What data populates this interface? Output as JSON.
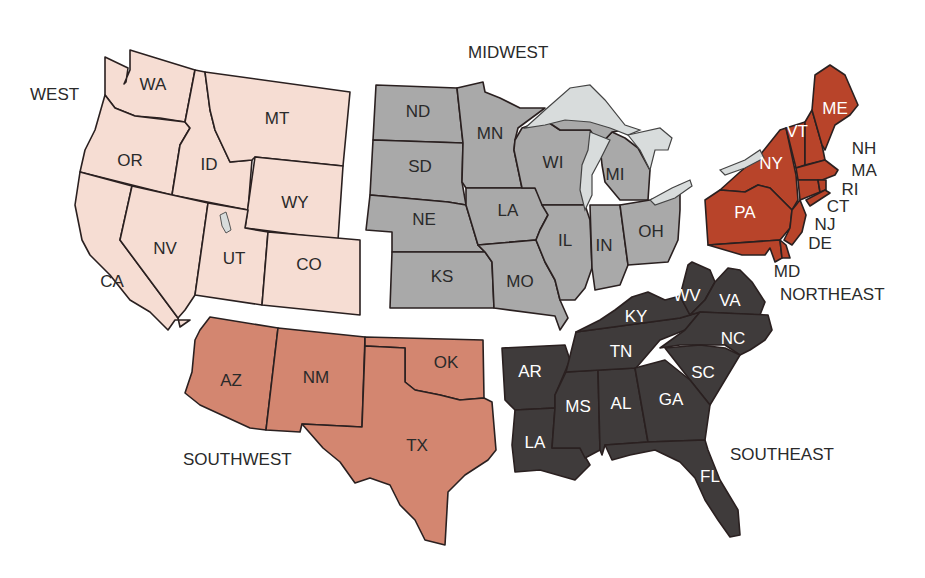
{
  "colors": {
    "west": "#f6ddd3",
    "midwest": "#a9a9a9",
    "southwest": "#d38670",
    "northeast": "#b8442a",
    "southeast": "#3f3b3b",
    "water": "#d8dcdc"
  },
  "regions": {
    "west": {
      "label": "WEST",
      "states": [
        "WA",
        "OR",
        "CA",
        "ID",
        "NV",
        "MT",
        "WY",
        "UT",
        "CO"
      ]
    },
    "midwest": {
      "label": "MIDWEST",
      "states": [
        "ND",
        "SD",
        "NE",
        "KS",
        "MN",
        "LA",
        "MO",
        "WI",
        "IL",
        "MI",
        "IN",
        "OH"
      ]
    },
    "northeast": {
      "label": "NORTHEAST",
      "states": [
        "ME",
        "VT",
        "NY",
        "PA",
        "NH",
        "MA",
        "RI",
        "CT",
        "NJ",
        "DE",
        "MD"
      ]
    },
    "southwest": {
      "label": "SOUTHWEST",
      "states": [
        "AZ",
        "NM",
        "OK",
        "TX"
      ]
    },
    "southeast": {
      "label": "SOUTHEAST",
      "states": [
        "WV",
        "VA",
        "KY",
        "NC",
        "TN",
        "SC",
        "AR",
        "MS",
        "AL",
        "GA",
        "LA",
        "FL"
      ]
    }
  },
  "states": {
    "WA": "WA",
    "OR": "OR",
    "CA": "CA",
    "ID": "ID",
    "NV": "NV",
    "MT": "MT",
    "WY": "WY",
    "UT": "UT",
    "CO": "CO",
    "ND": "ND",
    "SD": "SD",
    "NE": "NE",
    "KS": "KS",
    "MN": "MN",
    "IA": "LA",
    "MO": "MO",
    "WI": "WI",
    "IL": "IL",
    "MI": "MI",
    "IN": "IN",
    "OH": "OH",
    "ME": "ME",
    "VT": "VT",
    "NY": "NY",
    "PA": "PA",
    "NH": "NH",
    "MA": "MA",
    "RI": "RI",
    "CT": "CT",
    "NJ": "NJ",
    "DE": "DE",
    "MD": "MD",
    "AZ": "AZ",
    "NM": "NM",
    "OK": "OK",
    "TX": "TX",
    "WV": "WV",
    "VA": "VA",
    "KY": "KY",
    "NC": "NC",
    "TN": "TN",
    "SC": "SC",
    "AR": "AR",
    "MS": "MS",
    "AL": "AL",
    "GA": "GA",
    "LA": "LA",
    "FL": "FL"
  }
}
